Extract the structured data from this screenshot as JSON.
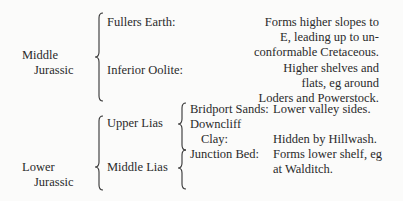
{
  "middle_jurassic": {
    "label_line1": "Middle",
    "label_line2": "Jurassic",
    "formations": [
      {
        "name": "Fullers Earth:",
        "description": [
          "Forms higher slopes to",
          "E, leading up to un-",
          "conformable Cretaceous."
        ]
      },
      {
        "name": "Inferior Oolite:",
        "description": [
          "Higher shelves and",
          "flats, eg around",
          "Loders and Powerstock."
        ]
      }
    ]
  },
  "lower_jurassic": {
    "label_line1": "Lower",
    "label_line2": "Jurassic",
    "groups": [
      {
        "name": "Upper Lias"
      },
      {
        "name": "Middle Lias"
      }
    ],
    "formations": [
      {
        "name": "Bridport Sands:",
        "description": [
          "Lower valley sides."
        ]
      },
      {
        "name_line1": "Downcliff",
        "name_line2": "Clay:",
        "description": [
          "Hidden by Hillwash."
        ]
      },
      {
        "name": "Junction Bed:",
        "description": [
          "Forms lower shelf, eg",
          "at Walditch."
        ]
      }
    ]
  }
}
